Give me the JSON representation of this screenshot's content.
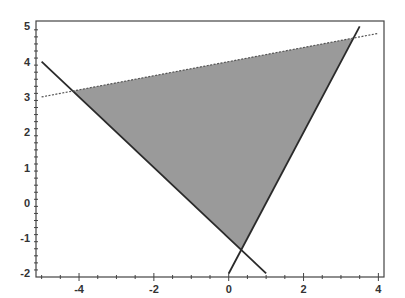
{
  "chart_data": {
    "type": "line",
    "title": "",
    "xlabel": "",
    "ylabel": "",
    "xlim": [
      -5.15,
      4.15
    ],
    "ylim": [
      -2.1,
      5.15
    ],
    "grid": false,
    "x_ticks": [
      -4,
      -2,
      0,
      2,
      4
    ],
    "y_ticks": [
      -2,
      -1,
      0,
      1,
      2,
      3,
      4,
      5
    ],
    "x_tick_labels": [
      "-4",
      "-2",
      "0",
      "2",
      "4"
    ],
    "y_tick_labels": [
      "-2",
      "-1",
      "0",
      "1",
      "2",
      "3",
      "4",
      "5"
    ],
    "series": [
      {
        "name": "y = -x - 1",
        "style": "solid",
        "x": [
          -5,
          1
        ],
        "y": [
          4,
          -2
        ]
      },
      {
        "name": "y = 2x - 2",
        "style": "solid",
        "x": [
          0,
          3.5
        ],
        "y": [
          -2,
          5
        ]
      },
      {
        "name": "y = x/5 + 4",
        "style": "dashed",
        "x": [
          -5,
          4
        ],
        "y": [
          3,
          4.8
        ]
      }
    ],
    "shaded_region": {
      "name": "feasible-triangle",
      "vertices": [
        [
          -4.17,
          3.17
        ],
        [
          3.33,
          4.67
        ],
        [
          0.33,
          -1.33
        ]
      ],
      "color": "#9a9a9a"
    },
    "colors": {
      "line": "#2a2a2a",
      "fill": "#9a9a9a",
      "axis": "#444444"
    }
  }
}
